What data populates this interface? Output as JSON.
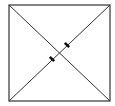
{
  "diagram": {
    "type": "geometry",
    "canvas": {
      "width": 115,
      "height": 106,
      "background": "#ffffff"
    },
    "stroke_color": "#333333",
    "tick_color": "#111111",
    "square": {
      "x1": 9,
      "y1": 5,
      "x2": 110,
      "y2": 101
    },
    "diagonals": [
      {
        "name": "diagonal-tl-br",
        "from": [
          9,
          5
        ],
        "to": [
          110,
          101
        ]
      },
      {
        "name": "diagonal-bl-tr",
        "from": [
          9,
          101
        ],
        "to": [
          110,
          5
        ]
      }
    ],
    "ticks": [
      {
        "name": "tick-lower",
        "center": [
          52,
          59
        ],
        "on": "diagonal-bl-tr"
      },
      {
        "name": "tick-upper",
        "center": [
          67,
          45
        ],
        "on": "diagonal-bl-tr"
      }
    ]
  }
}
